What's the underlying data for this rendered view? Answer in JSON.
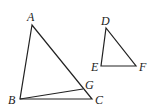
{
  "figure": {
    "triangle_abc": {
      "labels": {
        "A": "A",
        "B": "B",
        "C": "C",
        "G": "G"
      },
      "points": {
        "A": [
          32,
          25
        ],
        "B": [
          20,
          99
        ],
        "C": [
          92,
          99
        ],
        "G": [
          83,
          89
        ]
      }
    },
    "triangle_def": {
      "labels": {
        "D": "D",
        "E": "E",
        "F": "F"
      },
      "points": {
        "D": [
          106,
          28
        ],
        "E": [
          101,
          66
        ],
        "F": [
          136,
          66
        ]
      }
    },
    "stroke_color": "#222222"
  }
}
